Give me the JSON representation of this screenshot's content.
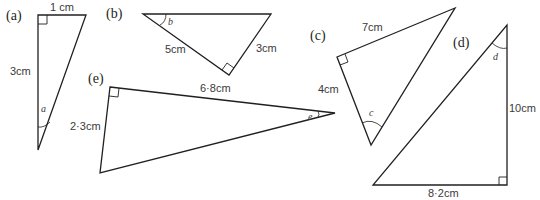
{
  "figure": {
    "triangles": [
      {
        "id": "a",
        "label": "(a)",
        "angle": "a",
        "sides": {
          "top": "1 cm",
          "left": "3cm"
        },
        "right_angle": "top-left"
      },
      {
        "id": "b",
        "label": "(b)",
        "angle": "b",
        "sides": {
          "left_slant": "5cm",
          "right_slant": "3cm"
        },
        "right_angle": "bottom"
      },
      {
        "id": "c",
        "label": "(c)",
        "angle": "c",
        "sides": {
          "top": "7cm",
          "left": "4cm"
        },
        "right_angle": "left"
      },
      {
        "id": "d",
        "label": "(d)",
        "angle": "d",
        "sides": {
          "right": "10cm",
          "bottom": "8·2cm"
        },
        "right_angle": "bottom-right"
      },
      {
        "id": "e",
        "label": "(e)",
        "angle": "e",
        "sides": {
          "top": "6·8cm",
          "left": "2·3cm"
        },
        "right_angle": "top-left"
      }
    ]
  }
}
